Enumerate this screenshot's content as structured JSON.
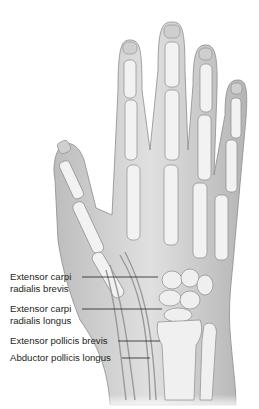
{
  "figure": {
    "labels": [
      {
        "id": "ecrb",
        "line1": "Extensor carpi",
        "line2": "radialis brevis"
      },
      {
        "id": "ecrl",
        "line1": "Extensor carpi",
        "line2": "radialis longus"
      },
      {
        "id": "epb",
        "line1": "Extensor pollicis brevis"
      },
      {
        "id": "apl",
        "line1": "Abductor pollicis longus"
      }
    ],
    "colors": {
      "skin": "#d9d9d9",
      "skin_shadow": "#a8a8a8",
      "bone": "#f2f2f2",
      "bone_outline": "#8c8c8c",
      "leader_line": "#231f20",
      "text": "#231f20"
    }
  }
}
